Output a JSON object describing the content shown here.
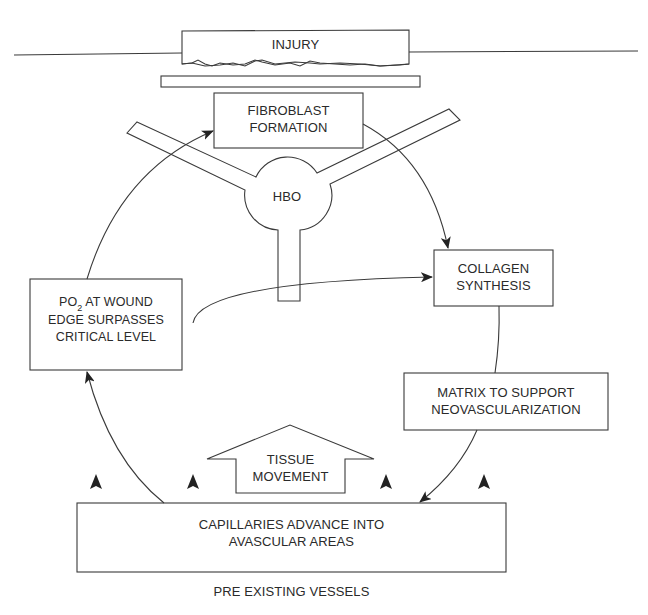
{
  "diagram": {
    "type": "wound-healing-cycle",
    "nodes": {
      "injury": {
        "label": "INJURY"
      },
      "fibroblast": {
        "line1": "FIBROBLAST",
        "line2": "FORMATION"
      },
      "hbo": {
        "label": "HBO"
      },
      "collagen": {
        "line1": "COLLAGEN",
        "line2": "SYNTHESIS"
      },
      "matrix": {
        "line1": "MATRIX TO SUPPORT",
        "line2": "NEOVASCULARIZATION"
      },
      "po2": {
        "prefix": "PO",
        "subscript": "2",
        "line1_rest": " AT WOUND",
        "line2": "EDGE SURPASSES",
        "line3": "CRITICAL LEVEL"
      },
      "tissue": {
        "line1": "TISSUE",
        "line2": "MOVEMENT"
      },
      "capillaries": {
        "line1": "CAPILLARIES ADVANCE INTO",
        "line2": "AVASCULAR AREAS"
      },
      "vessels": {
        "label": "PRE EXISTING VESSELS"
      }
    },
    "edges": [
      {
        "from": "po2",
        "to": "fibroblast"
      },
      {
        "from": "fibroblast",
        "to": "collagen"
      },
      {
        "from": "hbo",
        "to": "collagen"
      },
      {
        "from": "collagen",
        "to": "matrix"
      },
      {
        "from": "matrix",
        "to": "capillaries"
      },
      {
        "from": "capillaries",
        "to": "po2"
      }
    ],
    "colors": {
      "stroke": "#3a3a3a",
      "text": "#2a2a2a",
      "background": "#ffffff"
    }
  }
}
